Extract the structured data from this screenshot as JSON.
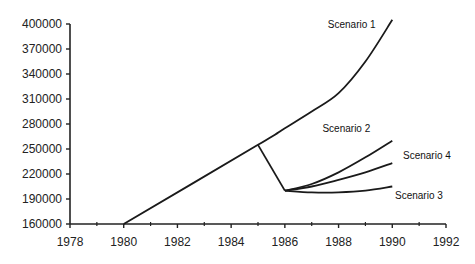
{
  "chart_data": {
    "type": "line",
    "title": "",
    "xlabel": "",
    "ylabel": "",
    "xlim": [
      1978,
      1992
    ],
    "ylim": [
      160000,
      400000
    ],
    "grid": false,
    "legend": "inline labels at line ends",
    "x_ticks": [
      "1978",
      "1980",
      "1982",
      "1984",
      "1986",
      "1988",
      "1990",
      "1992"
    ],
    "y_ticks": [
      "400000",
      "370000",
      "340000",
      "310000",
      "280000",
      "250000",
      "220000",
      "190000",
      "160000"
    ],
    "series": [
      {
        "name": "Scenario 1",
        "x": [
          1980,
          1985,
          1986,
          1987,
          1988,
          1989,
          1990
        ],
        "values": [
          160000,
          255000,
          275000,
          295000,
          317000,
          355000,
          405000
        ]
      },
      {
        "name": "Historical decline",
        "x": [
          1985,
          1986
        ],
        "values": [
          255000,
          200000
        ]
      },
      {
        "name": "Scenario 2",
        "x": [
          1986,
          1987,
          1988,
          1989,
          1990
        ],
        "values": [
          200000,
          208000,
          222000,
          240000,
          260000
        ]
      },
      {
        "name": "Scenario 4",
        "x": [
          1986,
          1987,
          1988,
          1989,
          1990
        ],
        "values": [
          200000,
          205000,
          213000,
          222000,
          233000
        ]
      },
      {
        "name": "Scenario 3",
        "x": [
          1986,
          1987,
          1988,
          1989,
          1990
        ],
        "values": [
          200000,
          198000,
          198000,
          200000,
          205000
        ]
      }
    ],
    "annotations": [
      {
        "text": "Scenario 1",
        "x": 1987.6,
        "y": 395000
      },
      {
        "text": "Scenario 2",
        "x": 1987.4,
        "y": 270000
      },
      {
        "text": "Scenario 4",
        "x": 1990.4,
        "y": 238000
      },
      {
        "text": "Scenario 3",
        "x": 1990.1,
        "y": 190000
      }
    ]
  }
}
